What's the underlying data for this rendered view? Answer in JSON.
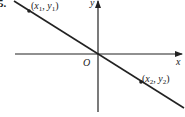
{
  "problem": {
    "number": "5."
  },
  "axes": {
    "x_label": "x",
    "y_label": "y",
    "origin_label": "O"
  },
  "line": {
    "description": "straight line through origin with negative slope",
    "color": "#222222"
  },
  "points": [
    {
      "label_x": "x",
      "sub_x": "1",
      "label_y": "y",
      "sub_y": "1",
      "position": "upper-left"
    },
    {
      "label_x": "x",
      "sub_x": "2",
      "label_y": "y",
      "sub_y": "2",
      "position": "lower-right"
    }
  ]
}
